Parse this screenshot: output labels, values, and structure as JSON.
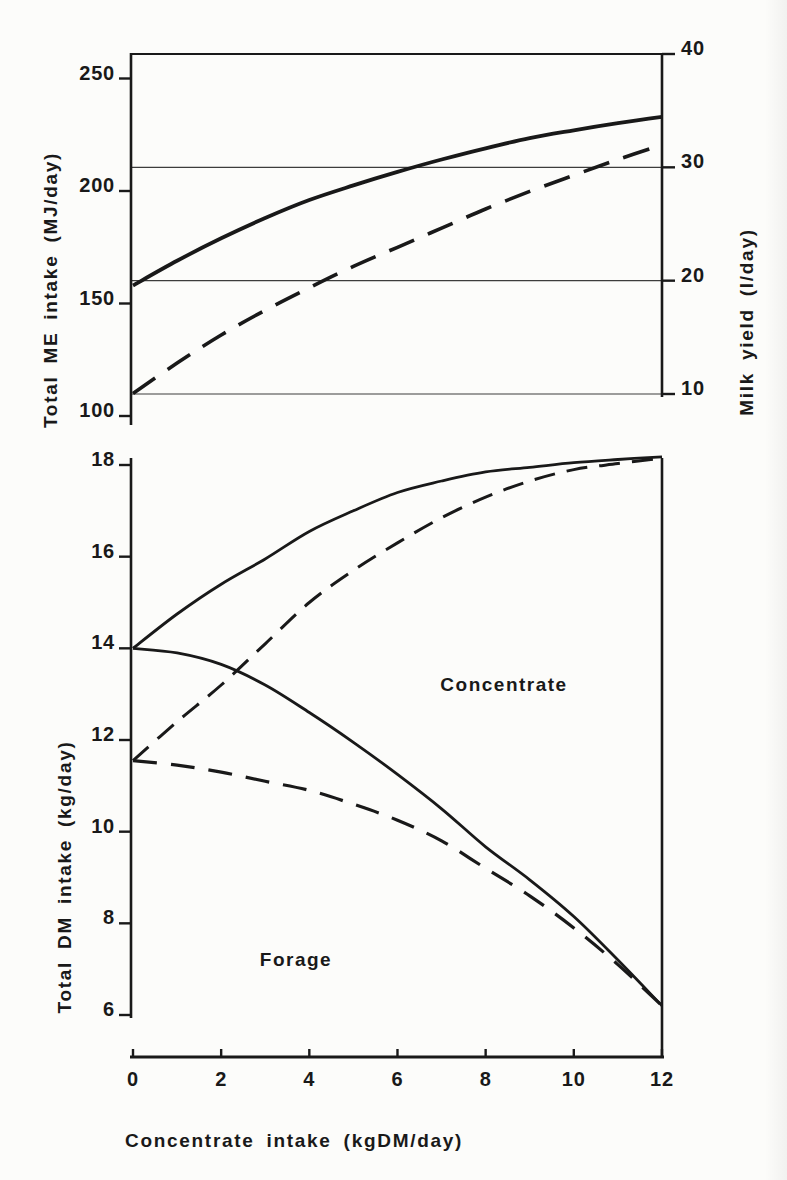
{
  "figure": {
    "ink_color": "#191919",
    "paper_color": "#fcfcfa"
  },
  "chart_data": [
    {
      "type": "line",
      "title": "",
      "x": {
        "min": 0,
        "max": 12
      },
      "y_left": {
        "label": "Total ME intake (MJ/day)",
        "min": 100,
        "max": 260,
        "ticks": [
          {
            "value": 250,
            "label": "250"
          },
          {
            "value": 200,
            "label": "200"
          },
          {
            "value": 150,
            "label": "150"
          },
          {
            "value": 100,
            "label": "100"
          }
        ]
      },
      "y_right": {
        "label": "Milk yield (l/day)",
        "min": 10,
        "max": 40,
        "ticks": [
          {
            "value": 40,
            "label": "40"
          },
          {
            "value": 30,
            "label": "30"
          },
          {
            "value": 20,
            "label": "20"
          },
          {
            "value": 10,
            "label": "10"
          }
        ],
        "gridlines": [
          30,
          20,
          10
        ],
        "top_frame_value": 40
      },
      "series": [
        {
          "name": "solid",
          "line_style": "solid",
          "axis": "left",
          "points": [
            [
              0,
              158
            ],
            [
              1,
              169
            ],
            [
              2,
              179
            ],
            [
              3,
              188
            ],
            [
              4,
              196
            ],
            [
              5,
              202.5
            ],
            [
              6,
              208.5
            ],
            [
              7,
              214
            ],
            [
              8,
              219
            ],
            [
              9,
              223.5
            ],
            [
              10,
              227
            ],
            [
              11,
              230.2
            ],
            [
              12,
              233
            ]
          ]
        },
        {
          "name": "dashed",
          "line_style": "dashed",
          "axis": "left",
          "points": [
            [
              0,
              110
            ],
            [
              1,
              123.5
            ],
            [
              2,
              136
            ],
            [
              3,
              147
            ],
            [
              4,
              157
            ],
            [
              5,
              166.5
            ],
            [
              6,
              175
            ],
            [
              7,
              183.5
            ],
            [
              8,
              192
            ],
            [
              9,
              199.8
            ],
            [
              10,
              207
            ],
            [
              11,
              214
            ],
            [
              12,
              220.5
            ]
          ]
        }
      ]
    },
    {
      "type": "line",
      "title": "",
      "x": {
        "label": "Concentrate intake (kgDM/day)",
        "min": 0,
        "max": 12,
        "ticks": [
          {
            "value": 0,
            "label": "0"
          },
          {
            "value": 2,
            "label": "2"
          },
          {
            "value": 4,
            "label": "4"
          },
          {
            "value": 6,
            "label": "6"
          },
          {
            "value": 8,
            "label": "8"
          },
          {
            "value": 10,
            "label": "10"
          },
          {
            "value": 12,
            "label": "12"
          }
        ]
      },
      "y_left": {
        "label": "Total DM intake (kg/day)",
        "min": 6,
        "max": 18.3,
        "ticks": [
          {
            "value": 18,
            "label": "18"
          },
          {
            "value": 16,
            "label": "16"
          },
          {
            "value": 14,
            "label": "14"
          },
          {
            "value": 12,
            "label": "12"
          },
          {
            "value": 10,
            "label": "10"
          },
          {
            "value": 8,
            "label": "8"
          },
          {
            "value": 6,
            "label": "6"
          }
        ]
      },
      "series": [
        {
          "name": "total-dm-solid",
          "line_style": "solid",
          "points": [
            [
              0,
              14
            ],
            [
              1,
              14.75
            ],
            [
              2,
              15.4
            ],
            [
              3,
              15.95
            ],
            [
              4,
              16.55
            ],
            [
              5,
              17.0
            ],
            [
              6,
              17.4
            ],
            [
              7,
              17.65
            ],
            [
              8,
              17.85
            ],
            [
              9,
              17.95
            ],
            [
              10,
              18.05
            ],
            [
              11,
              18.12
            ],
            [
              12,
              18.18
            ]
          ]
        },
        {
          "name": "total-dm-dashed",
          "line_style": "dashed",
          "points": [
            [
              0,
              11.55
            ],
            [
              1,
              12.4
            ],
            [
              2,
              13.2
            ],
            [
              3,
              14.1
            ],
            [
              4,
              15.0
            ],
            [
              5,
              15.7
            ],
            [
              6,
              16.3
            ],
            [
              7,
              16.85
            ],
            [
              8,
              17.3
            ],
            [
              9,
              17.65
            ],
            [
              10,
              17.9
            ],
            [
              11,
              18.03
            ],
            [
              12,
              18.15
            ]
          ]
        },
        {
          "name": "forage-boundary-solid",
          "line_style": "solid",
          "points": [
            [
              0,
              14
            ],
            [
              1,
              13.9
            ],
            [
              2,
              13.65
            ],
            [
              3,
              13.2
            ],
            [
              4,
              12.6
            ],
            [
              5,
              11.95
            ],
            [
              6,
              11.25
            ],
            [
              7,
              10.5
            ],
            [
              8,
              9.67
            ],
            [
              9,
              8.95
            ],
            [
              10,
              8.15
            ],
            [
              11,
              7.2
            ],
            [
              12,
              6.2
            ]
          ]
        },
        {
          "name": "forage-boundary-dashed",
          "line_style": "dashed",
          "points": [
            [
              0,
              11.55
            ],
            [
              1,
              11.45
            ],
            [
              2,
              11.3
            ],
            [
              3,
              11.1
            ],
            [
              4,
              10.9
            ],
            [
              5,
              10.6
            ],
            [
              6,
              10.25
            ],
            [
              7,
              9.8
            ],
            [
              8,
              9.2
            ],
            [
              9,
              8.6
            ],
            [
              10,
              7.9
            ],
            [
              11,
              7.1
            ],
            [
              12,
              6.2
            ]
          ]
        }
      ],
      "annotations": [
        {
          "text": "Concentrate"
        },
        {
          "text": "Forage"
        }
      ]
    }
  ]
}
